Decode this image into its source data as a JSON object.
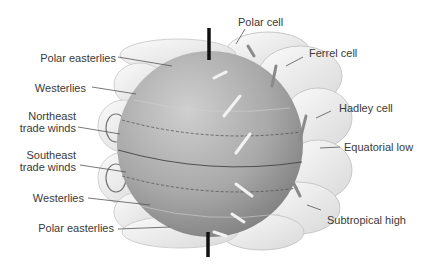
{
  "diagram": {
    "labels_left": [
      {
        "id": "polar-easterlies-north",
        "text": "Polar easterlies"
      },
      {
        "id": "westerlies-north",
        "text": "Westerlies"
      },
      {
        "id": "northeast-trade-winds-1",
        "text": "Northeast"
      },
      {
        "id": "northeast-trade-winds-2",
        "text": "trade winds"
      },
      {
        "id": "southeast-trade-winds-1",
        "text": "Southeast"
      },
      {
        "id": "southeast-trade-winds-2",
        "text": "trade winds"
      },
      {
        "id": "westerlies-south",
        "text": "Westerlies"
      },
      {
        "id": "polar-easterlies-south",
        "text": "Polar easterlies"
      }
    ],
    "labels_right": [
      {
        "id": "polar-cell",
        "text": "Polar cell"
      },
      {
        "id": "ferrel-cell",
        "text": "Ferrel cell"
      },
      {
        "id": "hadley-cell",
        "text": "Hadley cell"
      },
      {
        "id": "equatorial-low",
        "text": "Equatorial low"
      },
      {
        "id": "subtropical-high",
        "text": "Subtropical high"
      }
    ],
    "colors": {
      "globe_light": "#c4c4c4",
      "globe_dark": "#8a8a8a",
      "cell_fill": "#ececec",
      "cell_stroke": "#bdbdbd",
      "axis": "#111111",
      "leader": "#555555",
      "text": "#3a3a3a"
    }
  }
}
